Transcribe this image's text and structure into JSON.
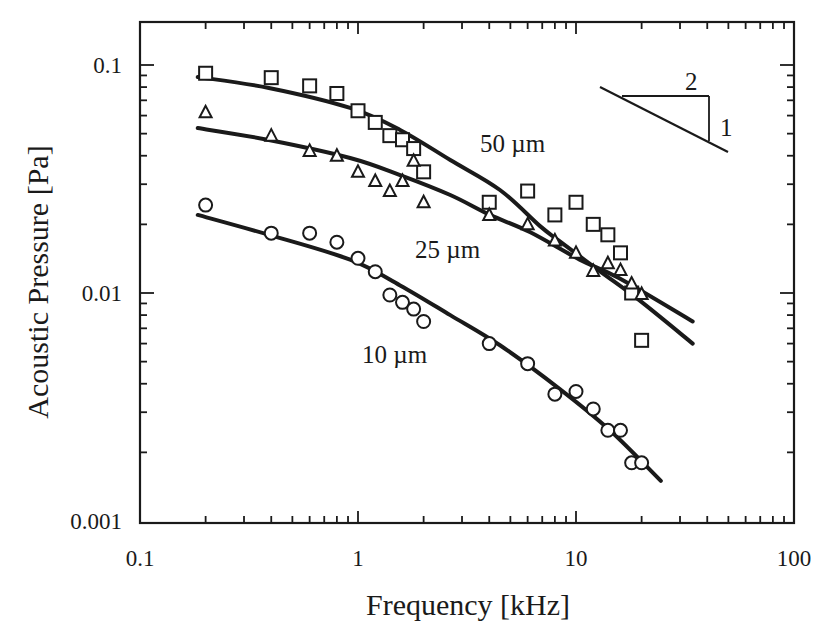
{
  "chart_data": {
    "type": "scatter",
    "title": "",
    "xlabel": "Frequency [kHz]",
    "ylabel": "Acoustic Pressure [Pa]",
    "xscale": "log",
    "yscale": "log",
    "xlim": [
      0.1,
      100
    ],
    "ylim": [
      0.001,
      0.1
    ],
    "x_ticks": [
      0.1,
      1,
      10,
      100
    ],
    "x_tick_labels": [
      "0.1",
      "1",
      "10",
      "100"
    ],
    "y_ticks": [
      0.001,
      0.01,
      0.1
    ],
    "y_tick_labels": [
      "0.001",
      "0.01",
      "0.1"
    ],
    "grid": false,
    "legend": "none (inline labels)",
    "series": [
      {
        "name": "50 µm",
        "marker": "square",
        "label_pos": [
          480,
          152
        ],
        "x": [
          0.2,
          0.4,
          0.6,
          0.8,
          1.0,
          1.2,
          1.4,
          1.6,
          1.8,
          2.0,
          4,
          6,
          8,
          10,
          12,
          14,
          16,
          18,
          20
        ],
        "values": [
          0.092,
          0.088,
          0.081,
          0.075,
          0.063,
          0.056,
          0.049,
          0.047,
          0.043,
          0.034,
          0.025,
          0.028,
          0.022,
          0.025,
          0.02,
          0.018,
          0.015,
          0.01,
          0.0062
        ],
        "fit": [
          [
            0.184,
            0.0886
          ],
          [
            0.39,
            0.0793
          ],
          [
            0.92,
            0.0648
          ],
          [
            1.56,
            0.0519
          ],
          [
            2.65,
            0.0383
          ],
          [
            4.48,
            0.0283
          ],
          [
            6.82,
            0.0197
          ],
          [
            8.4,
            0.0169
          ],
          [
            12.8,
            0.0125
          ],
          [
            19.5,
            0.0093
          ],
          [
            34.3,
            0.006
          ]
        ]
      },
      {
        "name": "25 µm",
        "marker": "triangle",
        "label_pos": [
          415,
          258
        ],
        "x": [
          0.2,
          0.4,
          0.6,
          0.8,
          1.0,
          1.2,
          1.4,
          1.6,
          1.8,
          2.0,
          4,
          6,
          8,
          10,
          12,
          14,
          16,
          18,
          20
        ],
        "values": [
          0.062,
          0.049,
          0.042,
          0.04,
          0.034,
          0.031,
          0.028,
          0.031,
          0.038,
          0.025,
          0.022,
          0.02,
          0.017,
          0.015,
          0.0125,
          0.0135,
          0.0126,
          0.011,
          0.0099
        ],
        "fit": [
          [
            0.184,
            0.0529
          ],
          [
            0.39,
            0.0469
          ],
          [
            0.92,
            0.0391
          ],
          [
            1.56,
            0.0329
          ],
          [
            2.65,
            0.0269
          ],
          [
            4.03,
            0.022
          ],
          [
            6.14,
            0.0185
          ],
          [
            10.4,
            0.014
          ],
          [
            15.8,
            0.0116
          ],
          [
            34.3,
            0.0075
          ]
        ]
      },
      {
        "name": "10 µm",
        "marker": "circle",
        "label_pos": [
          362,
          363
        ],
        "x": [
          0.2,
          0.4,
          0.6,
          0.8,
          1.0,
          1.2,
          1.4,
          1.6,
          1.8,
          2.0,
          4,
          6,
          8,
          10,
          12,
          14,
          16,
          18,
          20
        ],
        "values": [
          0.0243,
          0.0183,
          0.0183,
          0.0167,
          0.0142,
          0.0124,
          0.0098,
          0.0091,
          0.0085,
          0.0075,
          0.006,
          0.0049,
          0.0036,
          0.0037,
          0.0031,
          0.0025,
          0.0025,
          0.0018,
          0.0018
        ],
        "fit": [
          [
            0.184,
            0.022
          ],
          [
            0.39,
            0.018
          ],
          [
            0.92,
            0.014
          ],
          [
            1.56,
            0.0108
          ],
          [
            2.65,
            0.008
          ],
          [
            4.48,
            0.0059
          ],
          [
            8.4,
            0.0038
          ],
          [
            14.3,
            0.0025
          ],
          [
            24.5,
            0.0015
          ]
        ]
      }
    ],
    "annotations": [
      {
        "type": "slope-triangle",
        "run_label": "2",
        "rise_label": "1",
        "meaning": "slope -1/2 reference"
      }
    ]
  },
  "labels": {
    "slope_run": "2",
    "slope_rise": "1"
  },
  "style": {
    "ink": "#1a1a1a",
    "background": "#ffffff"
  }
}
